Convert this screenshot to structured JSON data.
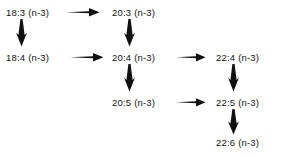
{
  "diagram": {
    "type": "flow-diagram",
    "background_color": "#ffffff",
    "text_color": "#111111",
    "nodes": [
      {
        "id": "18:3",
        "label": "18:3 (n-3)",
        "row": 1,
        "column": 1
      },
      {
        "id": "20:3",
        "label": "20:3 (n-3)",
        "row": 1,
        "column": 2
      },
      {
        "id": "18:4",
        "label": "18:4 (n-3)",
        "row": 2,
        "column": 1
      },
      {
        "id": "20:4",
        "label": "20:4 (n-3)",
        "row": 2,
        "column": 2
      },
      {
        "id": "22:4",
        "label": "22:4 (n-3)",
        "row": 2,
        "column": 3
      },
      {
        "id": "20:5",
        "label": "20:5 (n-3)",
        "row": 3,
        "column": 2
      },
      {
        "id": "22:5",
        "label": "22:5 (n-3)",
        "row": 3,
        "column": 3
      },
      {
        "id": "22:6",
        "label": "22:6 (n-3)",
        "row": 4,
        "column": 3
      }
    ],
    "edges": [
      {
        "from": "18:3",
        "to": "20:3",
        "direction": "right",
        "icon": "arrow-right-icon"
      },
      {
        "from": "18:4",
        "to": "20:4",
        "direction": "right",
        "icon": "arrow-right-icon"
      },
      {
        "from": "20:4",
        "to": "22:4",
        "direction": "right",
        "icon": "arrow-right-icon"
      },
      {
        "from": "20:5",
        "to": "22:5",
        "direction": "right",
        "icon": "arrow-right-icon"
      },
      {
        "from": "18:3",
        "to": "18:4",
        "direction": "down",
        "icon": "arrow-down-icon"
      },
      {
        "from": "20:3",
        "to": "20:4",
        "direction": "down",
        "icon": "arrow-down-icon"
      },
      {
        "from": "20:4",
        "to": "20:5",
        "direction": "down",
        "icon": "arrow-down-icon"
      },
      {
        "from": "22:4",
        "to": "22:5",
        "direction": "down",
        "icon": "arrow-down-icon"
      },
      {
        "from": "22:5",
        "to": "22:6",
        "direction": "down",
        "icon": "arrow-down-icon"
      }
    ]
  }
}
